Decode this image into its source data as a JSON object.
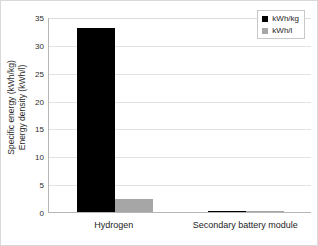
{
  "chart_data": {
    "type": "bar",
    "title": "",
    "subtitle": "",
    "xlabel": "",
    "ylabel": "Specific energy (kWh/kg) Energy density (kWh/l)",
    "ylabel_line1": "Specific energy (kWh/kg)",
    "ylabel_line2": "Energy density (kWh/l)",
    "categories": [
      "Hydrogen",
      "Secondary battery module"
    ],
    "series": [
      {
        "name": "kWh/kg",
        "color": "#000000",
        "values": [
          33.0,
          0.15
        ]
      },
      {
        "name": "kWh/l",
        "color": "#a6a6a6",
        "values": [
          2.3,
          0.1
        ]
      }
    ],
    "ylim": [
      0,
      35
    ],
    "ytick_values": [
      0,
      5,
      10,
      15,
      20,
      25,
      30,
      35
    ],
    "ytick_labels": [
      "0",
      "5",
      "10",
      "15",
      "20",
      "25",
      "30",
      "35"
    ],
    "grid": true,
    "grid_axis": "y",
    "legend_position": "top-right",
    "annotations": []
  },
  "legend": {
    "entries": [
      {
        "label": "kWh/kg"
      },
      {
        "label": "kWh/l"
      }
    ]
  }
}
